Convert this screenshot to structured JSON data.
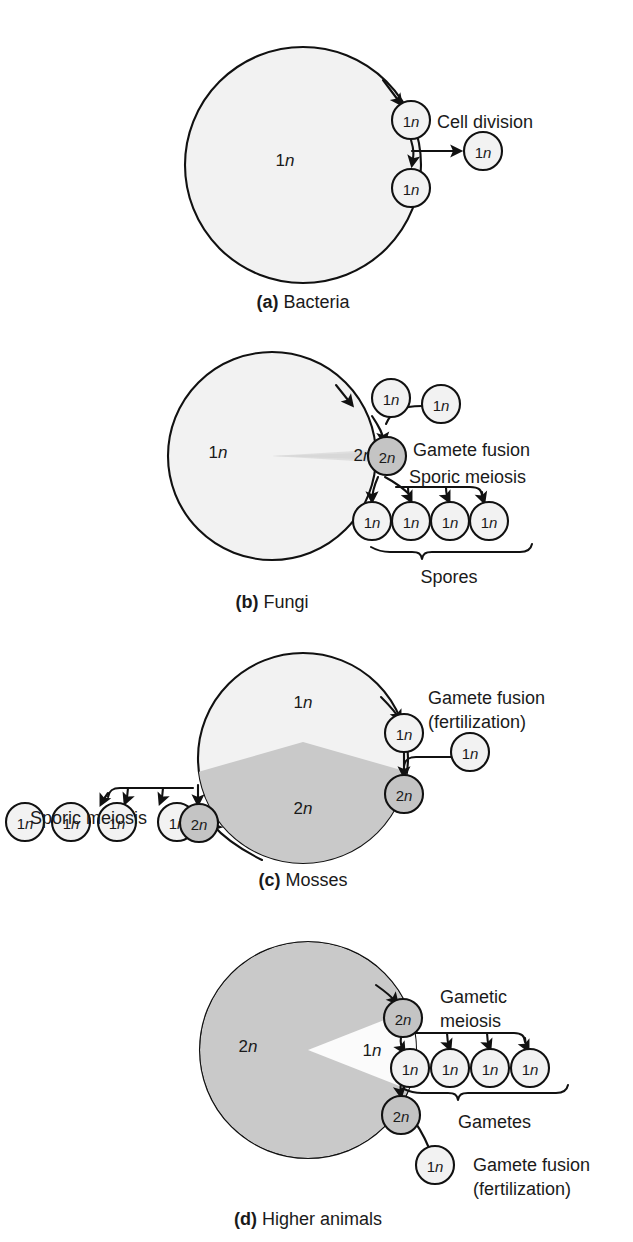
{
  "figure": {
    "background_color": "#ffffff",
    "ink_color": "#111111",
    "haploid_fill": "#f2f2f2",
    "diploid_fill": "#c9c9c9",
    "node_diploid_fill": "#c4c4c4"
  },
  "panels": [
    {
      "id": "a",
      "caption_letter": "(a)",
      "caption_text": "Bacteria",
      "cycle_region_labels": [
        {
          "text_prefix": "1",
          "text_italic": "n"
        }
      ],
      "nodes": [
        {
          "name": "node-a-top",
          "prefix": "1",
          "italic": "n",
          "ploidy": "haploid"
        },
        {
          "name": "node-a-bottom",
          "prefix": "1",
          "italic": "n",
          "ploidy": "haploid"
        },
        {
          "name": "node-a-daughter",
          "prefix": "1",
          "italic": "n",
          "ploidy": "haploid"
        }
      ],
      "annotations": [
        {
          "name": "cell-division-label",
          "text": "Cell division"
        }
      ]
    },
    {
      "id": "b",
      "caption_letter": "(b)",
      "caption_text": "Fungi",
      "cycle_region_labels": [
        {
          "text_prefix": "1",
          "text_italic": "n"
        },
        {
          "text_prefix": "2",
          "text_italic": "n"
        }
      ],
      "nodes": [
        {
          "name": "node-b-gamete-left",
          "prefix": "1",
          "italic": "n",
          "ploidy": "haploid"
        },
        {
          "name": "node-b-gamete-right",
          "prefix": "1",
          "italic": "n",
          "ploidy": "haploid"
        },
        {
          "name": "node-b-zygote",
          "prefix": "2",
          "italic": "n",
          "ploidy": "diploid"
        },
        {
          "name": "node-b-spore-1",
          "prefix": "1",
          "italic": "n",
          "ploidy": "haploid"
        },
        {
          "name": "node-b-spore-2",
          "prefix": "1",
          "italic": "n",
          "ploidy": "haploid"
        },
        {
          "name": "node-b-spore-3",
          "prefix": "1",
          "italic": "n",
          "ploidy": "haploid"
        },
        {
          "name": "node-b-spore-4",
          "prefix": "1",
          "italic": "n",
          "ploidy": "haploid"
        }
      ],
      "annotations": [
        {
          "name": "gamete-fusion-label",
          "text": "Gamete fusion"
        },
        {
          "name": "sporic-meiosis-label",
          "text": "Sporic meiosis"
        },
        {
          "name": "spores-brace-label",
          "text": "Spores"
        }
      ]
    },
    {
      "id": "c",
      "caption_letter": "(c)",
      "caption_text": "Mosses",
      "cycle_region_labels": [
        {
          "text_prefix": "1",
          "text_italic": "n"
        },
        {
          "text_prefix": "2",
          "text_italic": "n"
        }
      ],
      "nodes": [
        {
          "name": "node-c-spore-1",
          "prefix": "1",
          "italic": "n",
          "ploidy": "haploid"
        },
        {
          "name": "node-c-spore-2",
          "prefix": "1",
          "italic": "n",
          "ploidy": "haploid"
        },
        {
          "name": "node-c-spore-3",
          "prefix": "1",
          "italic": "n",
          "ploidy": "haploid"
        },
        {
          "name": "node-c-spore-4",
          "prefix": "1",
          "italic": "n",
          "ploidy": "haploid"
        },
        {
          "name": "node-c-sporophyte",
          "prefix": "2",
          "italic": "n",
          "ploidy": "diploid"
        },
        {
          "name": "node-c-gamete",
          "prefix": "1",
          "italic": "n",
          "ploidy": "haploid"
        },
        {
          "name": "node-c-gamete-partner",
          "prefix": "1",
          "italic": "n",
          "ploidy": "haploid"
        },
        {
          "name": "node-c-zygote",
          "prefix": "2",
          "italic": "n",
          "ploidy": "diploid"
        }
      ],
      "annotations": [
        {
          "name": "sporic-meiosis-label",
          "text": "Sporic meiosis"
        },
        {
          "name": "gamete-fusion-label",
          "text": "Gamete fusion"
        },
        {
          "name": "fertilization-label",
          "text": "(fertilization)"
        }
      ]
    },
    {
      "id": "d",
      "caption_letter": "(d)",
      "caption_text": "Higher animals",
      "cycle_region_labels": [
        {
          "text_prefix": "2",
          "text_italic": "n"
        },
        {
          "text_prefix": "1",
          "text_italic": "n"
        }
      ],
      "nodes": [
        {
          "name": "node-d-germ-cell",
          "prefix": "2",
          "italic": "n",
          "ploidy": "diploid"
        },
        {
          "name": "node-d-gamete-1",
          "prefix": "1",
          "italic": "n",
          "ploidy": "haploid"
        },
        {
          "name": "node-d-gamete-2",
          "prefix": "1",
          "italic": "n",
          "ploidy": "haploid"
        },
        {
          "name": "node-d-gamete-3",
          "prefix": "1",
          "italic": "n",
          "ploidy": "haploid"
        },
        {
          "name": "node-d-gamete-4",
          "prefix": "1",
          "italic": "n",
          "ploidy": "haploid"
        },
        {
          "name": "node-d-zygote",
          "prefix": "2",
          "italic": "n",
          "ploidy": "diploid"
        },
        {
          "name": "node-d-gamete-partner",
          "prefix": "1",
          "italic": "n",
          "ploidy": "haploid"
        }
      ],
      "annotations": [
        {
          "name": "gametic-label",
          "text": "Gametic"
        },
        {
          "name": "meiosis-label",
          "text": "meiosis"
        },
        {
          "name": "gametes-brace-label",
          "text": "Gametes"
        },
        {
          "name": "gamete-fusion-label",
          "text": "Gamete fusion"
        },
        {
          "name": "fertilization-label",
          "text": "(fertilization)"
        }
      ]
    }
  ]
}
